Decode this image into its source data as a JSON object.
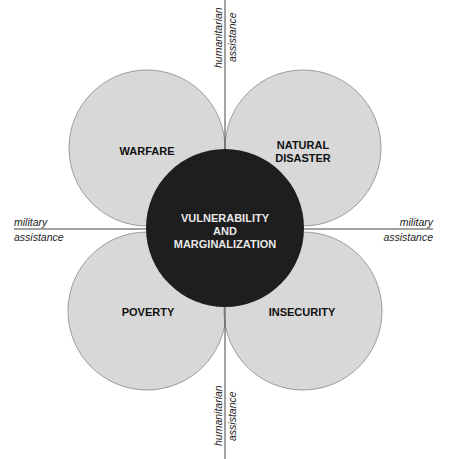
{
  "diagram": {
    "center": {
      "lines": [
        "VULNERABILITY",
        "AND",
        "MARGINALIZATION"
      ],
      "fill": "#1e1e1e",
      "text_color": "#e8e8e8"
    },
    "petals": [
      {
        "id": "top-left",
        "lines": [
          "WARFARE"
        ]
      },
      {
        "id": "top-right",
        "lines": [
          "NATURAL",
          "DISASTER"
        ]
      },
      {
        "id": "bottom-left",
        "lines": [
          "POVERTY"
        ]
      },
      {
        "id": "bottom-right",
        "lines": [
          "INSECURITY"
        ]
      }
    ],
    "petal_fill": "#d8d8d8",
    "axes": {
      "top": {
        "line1": "humanitarian",
        "line2": "assistance"
      },
      "bottom": {
        "line1": "humanitarian",
        "line2": "assistance"
      },
      "left": {
        "line1": "military",
        "line2": "assistance"
      },
      "right": {
        "line1": "military",
        "line2": "assistance"
      }
    }
  }
}
